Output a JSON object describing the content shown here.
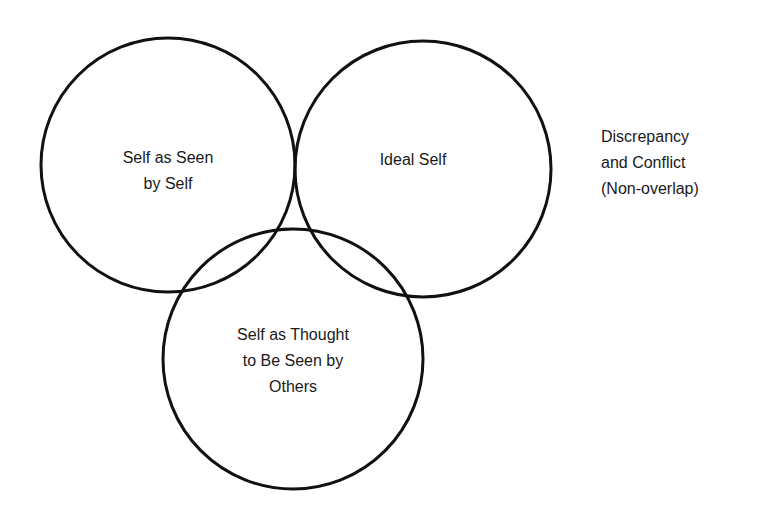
{
  "diagram": {
    "stroke_color": "#111111",
    "background": "#ffffff",
    "circles": [
      {
        "id": "self-as-seen-by-self",
        "cx": 168,
        "cy": 165,
        "r": 127,
        "lines": [
          "Self as Seen",
          "by Self"
        ]
      },
      {
        "id": "ideal-self",
        "cx": 423,
        "cy": 169,
        "r": 128,
        "lines": [
          "Ideal Self"
        ]
      },
      {
        "id": "self-as-thought-seen-by-others",
        "cx": 293,
        "cy": 359,
        "r": 130,
        "lines": [
          "Self as Thought",
          "to Be Seen by",
          "Others"
        ]
      }
    ],
    "side_note": {
      "lines": [
        "Discrepancy",
        "and Conflict",
        "(Non-overlap)"
      ]
    }
  }
}
